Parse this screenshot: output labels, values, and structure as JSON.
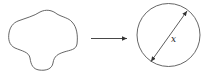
{
  "diagram": {
    "shape_left": "irregular-blob",
    "arrow": "transform-arrow",
    "shape_right": "circle",
    "diameter_label": "x",
    "colors": {
      "stroke": "#444444",
      "background": "#ffffff"
    }
  }
}
